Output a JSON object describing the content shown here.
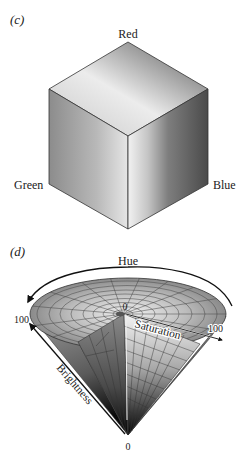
{
  "panel_c": {
    "label": "(c)",
    "title": "RGB color cube",
    "vertices": {
      "top": "Red",
      "left": "Green",
      "right": "Blue"
    }
  },
  "panel_d": {
    "label": "(d)",
    "title": "HSB color cone",
    "hue_label": "Hue",
    "saturation_label": "Saturation",
    "saturation_min": "0",
    "saturation_max": "100",
    "brightness_label": "Brightness",
    "brightness_min": "0",
    "brightness_max": "100"
  },
  "colors": {
    "edge": "#333333",
    "text": "#222222",
    "arrow": "#111111"
  }
}
